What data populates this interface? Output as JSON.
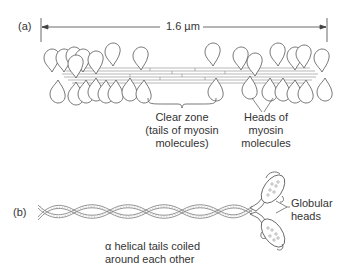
{
  "panel_a": {
    "label": "(a)",
    "scale_label": "1.6 µm",
    "clear_zone": {
      "line1": "Clear zone",
      "line2": "(tails of myosin",
      "line3": "molecules)"
    },
    "heads": {
      "line1": "Heads of",
      "line2": "myosin",
      "line3": "molecules"
    }
  },
  "panel_b": {
    "label": "(b)",
    "globular": {
      "line1": "Globular",
      "line2": "heads"
    },
    "tails": {
      "line1": "α helical tails coiled",
      "line2": "around each other"
    }
  },
  "colors": {
    "line": "#555555",
    "fiber": "#9a9a9a",
    "background": "#ffffff"
  }
}
